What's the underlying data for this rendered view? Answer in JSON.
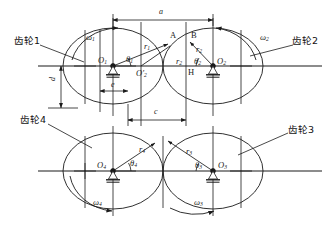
{
  "figure": {
    "type": "mechanism-diagram",
    "title": "",
    "background_color": "#ffffff",
    "line_color": "#1a1a1a"
  },
  "gear_labels": [
    {
      "id": "gear1",
      "text": "齿轮1",
      "x": 14,
      "y": 42
    },
    {
      "id": "gear2",
      "text": "齿轮2",
      "x": 296,
      "y": 42
    },
    {
      "id": "gear3",
      "text": "齿轮3",
      "x": 291,
      "y": 131
    },
    {
      "id": "gear4",
      "text": "齿轮4",
      "x": 22,
      "y": 121
    }
  ],
  "centers": [
    {
      "id": "O1",
      "base": "O",
      "sub": "1",
      "x": 113,
      "y": 66
    },
    {
      "id": "O2p",
      "base": "O",
      "sub": "2",
      "prime": true,
      "x": 141,
      "y": 66
    },
    {
      "id": "O2",
      "base": "O",
      "sub": "2",
      "x": 213,
      "y": 66
    },
    {
      "id": "O3",
      "base": "O",
      "sub": "3",
      "x": 213,
      "y": 171
    },
    {
      "id": "O4",
      "base": "O",
      "sub": "4",
      "x": 113,
      "y": 171
    }
  ],
  "points": [
    {
      "id": "A",
      "text": "A",
      "x": 172,
      "y": 36
    },
    {
      "id": "B",
      "text": "B",
      "x": 193,
      "y": 36
    },
    {
      "id": "H",
      "text": "H",
      "x": 186,
      "y": 72
    }
  ],
  "radii": [
    {
      "id": "r1",
      "base": "r",
      "sub": "1",
      "x": 146,
      "y": 47
    },
    {
      "id": "r2_left",
      "base": "r",
      "sub": "2",
      "x": 178,
      "y": 62
    },
    {
      "id": "r2_right",
      "base": "r",
      "sub": "2",
      "x": 197,
      "y": 50
    },
    {
      "id": "r3",
      "base": "r",
      "sub": "3",
      "x": 188,
      "y": 152
    },
    {
      "id": "r4",
      "base": "r",
      "sub": "4",
      "x": 141,
      "y": 150
    }
  ],
  "angles": [
    {
      "id": "theta1",
      "base": "θ",
      "sub": "1",
      "x": 128,
      "y": 60
    },
    {
      "id": "theta2",
      "base": "θ",
      "sub": "2",
      "x": 196,
      "y": 62
    },
    {
      "id": "theta3",
      "base": "θ",
      "sub": "3",
      "x": 197,
      "y": 166
    },
    {
      "id": "theta4",
      "base": "θ",
      "sub": "4",
      "x": 132,
      "y": 164
    }
  ],
  "angular_velocities": [
    {
      "id": "w1",
      "base": "ω",
      "sub": "1",
      "x": 88,
      "y": 38
    },
    {
      "id": "w2",
      "base": "ω",
      "sub": "2",
      "x": 263,
      "y": 38
    },
    {
      "id": "w3",
      "base": "ω",
      "sub": "3",
      "x": 197,
      "y": 203
    },
    {
      "id": "w4",
      "base": "ω",
      "sub": "4",
      "x": 96,
      "y": 203
    }
  ],
  "dimensions": [
    {
      "id": "a",
      "text": "a",
      "x": 160,
      "y": 12,
      "orientation": "horizontal",
      "from_x": 113,
      "to_x": 213,
      "line_y": 20
    },
    {
      "id": "c",
      "text": "c",
      "x": 155,
      "y": 111,
      "orientation": "horizontal",
      "from_x": 128,
      "to_x": 186,
      "line_y": 120
    },
    {
      "id": "d",
      "text": "d",
      "x": 50,
      "y": 84,
      "orientation": "vertical",
      "from_y": 66,
      "to_y": 108,
      "line_x": 61
    },
    {
      "id": "e",
      "text": "e",
      "x": 111,
      "y": 84,
      "orientation": "horizontal",
      "from_x": 100,
      "to_x": 128,
      "line_y": 91
    }
  ],
  "ellipses": [
    {
      "id": "gear1-body",
      "cx": 113,
      "cy": 66,
      "rx": 50,
      "ry": 38
    },
    {
      "id": "gear2-body",
      "cx": 213,
      "cy": 66,
      "rx": 50,
      "ry": 38
    },
    {
      "id": "gear4-body",
      "cx": 113,
      "cy": 171,
      "rx": 50,
      "ry": 38
    },
    {
      "id": "gear3-body",
      "cx": 213,
      "cy": 171,
      "rx": 50,
      "ry": 38
    }
  ]
}
